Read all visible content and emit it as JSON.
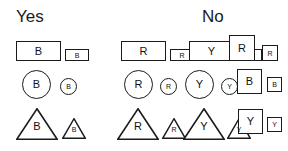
{
  "headers": {
    "yes": "Yes",
    "no": "No"
  },
  "style": {
    "stroke_color": "#1b1b1b",
    "background_color": "#ffffff",
    "text_color": "#111111"
  },
  "rows": [
    {
      "row_id": "rectangles",
      "yes": [
        {
          "shape": "rectangle",
          "size": "large",
          "label": "B",
          "x": 16,
          "y": 41,
          "w": 45,
          "h": 20
        },
        {
          "shape": "rectangle",
          "size": "small",
          "label": "B",
          "x": 65,
          "y": 49,
          "w": 24,
          "h": 12
        }
      ],
      "no": [
        {
          "shape": "rectangle",
          "size": "large",
          "label": "R",
          "x": 121,
          "y": 41,
          "w": 45,
          "h": 20
        },
        {
          "shape": "rectangle",
          "size": "small",
          "label": "R",
          "x": 170,
          "y": 49,
          "w": 24,
          "h": 12
        },
        {
          "shape": "rectangle",
          "size": "large",
          "label": "Y",
          "x": 189,
          "y": 41,
          "w": 45,
          "h": 20
        },
        {
          "shape": "rectangle",
          "size": "small",
          "label": "Y",
          "x": 238,
          "y": 49,
          "w": 24,
          "h": 12
        },
        {
          "shape": "square",
          "size": "large",
          "label": "R",
          "x": 229,
          "y": 35,
          "w": 26,
          "h": 26
        },
        {
          "shape": "square",
          "size": "small",
          "label": "R",
          "x": 262,
          "y": 45,
          "w": 16,
          "h": 16
        }
      ]
    },
    {
      "row_id": "circles",
      "yes": [
        {
          "shape": "circle",
          "size": "large",
          "label": "B",
          "x": 22,
          "y": 70,
          "w": 29,
          "h": 29
        },
        {
          "shape": "circle",
          "size": "small",
          "label": "B",
          "x": 60,
          "y": 78,
          "w": 17,
          "h": 17
        }
      ],
      "no": [
        {
          "shape": "circle",
          "size": "large",
          "label": "R",
          "x": 124,
          "y": 70,
          "w": 29,
          "h": 29
        },
        {
          "shape": "circle",
          "size": "small",
          "label": "R",
          "x": 160,
          "y": 78,
          "w": 17,
          "h": 17
        },
        {
          "shape": "circle",
          "size": "large",
          "label": "Y",
          "x": 185,
          "y": 70,
          "w": 29,
          "h": 29
        },
        {
          "shape": "circle",
          "size": "small",
          "label": "Y",
          "x": 221,
          "y": 78,
          "w": 17,
          "h": 17
        },
        {
          "shape": "square",
          "size": "large",
          "label": "B",
          "x": 237,
          "y": 69,
          "w": 25,
          "h": 25
        },
        {
          "shape": "square",
          "size": "small",
          "label": "B",
          "x": 267,
          "y": 77,
          "w": 15,
          "h": 15
        }
      ]
    },
    {
      "row_id": "triangles",
      "yes": [
        {
          "shape": "triangle",
          "size": "large",
          "label": "B",
          "x": 16,
          "y": 108,
          "w": 42,
          "h": 32
        },
        {
          "shape": "triangle",
          "size": "small",
          "label": "B",
          "x": 62,
          "y": 118,
          "w": 24,
          "h": 21
        }
      ],
      "no": [
        {
          "shape": "triangle",
          "size": "large",
          "label": "R",
          "x": 117,
          "y": 108,
          "w": 42,
          "h": 32
        },
        {
          "shape": "triangle",
          "size": "small",
          "label": "R",
          "x": 162,
          "y": 118,
          "w": 24,
          "h": 21
        },
        {
          "shape": "triangle",
          "size": "large",
          "label": "Y",
          "x": 183,
          "y": 108,
          "w": 42,
          "h": 32
        },
        {
          "shape": "triangle",
          "size": "small",
          "label": "Y",
          "x": 227,
          "y": 118,
          "w": 24,
          "h": 21
        },
        {
          "shape": "square",
          "size": "large",
          "label": "Y",
          "x": 238,
          "y": 109,
          "w": 25,
          "h": 25
        },
        {
          "shape": "square",
          "size": "small",
          "label": "Y",
          "x": 267,
          "y": 117,
          "w": 15,
          "h": 15
        }
      ]
    }
  ],
  "header_positions": {
    "yes_x": 16,
    "yes_y": 8,
    "no_x": 202,
    "no_y": 8
  }
}
